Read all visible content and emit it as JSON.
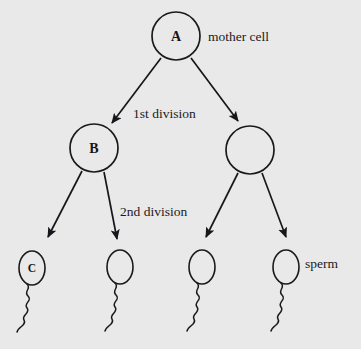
{
  "diagram": {
    "background_color": "#e9e9e9",
    "ink_color": "#1a1a1e",
    "cells": [
      {
        "id": "mother-cell",
        "label": "A",
        "annotation": "mother cell",
        "shape": "circle",
        "cx": 176,
        "cy": 36,
        "r": 24,
        "annotation_x": 208,
        "annotation_y": 41
      },
      {
        "id": "daughter-cell-left",
        "label": "B",
        "annotation": "",
        "shape": "circle",
        "cx": 94,
        "cy": 148,
        "r": 24,
        "annotation_x": 0,
        "annotation_y": 0
      },
      {
        "id": "daughter-cell-right",
        "label": "",
        "annotation": "",
        "shape": "circle",
        "cx": 250,
        "cy": 150,
        "r": 24,
        "annotation_x": 0,
        "annotation_y": 0
      }
    ],
    "sperm": [
      {
        "id": "sperm-1",
        "label": "C",
        "annotation": "",
        "cx": 32,
        "cy": 268,
        "rx": 13,
        "ry": 17,
        "annotation_x": 0,
        "annotation_y": 0
      },
      {
        "id": "sperm-2",
        "label": "",
        "annotation": "",
        "cx": 120,
        "cy": 267,
        "rx": 13,
        "ry": 17,
        "annotation_x": 0,
        "annotation_y": 0
      },
      {
        "id": "sperm-3",
        "label": "",
        "annotation": "",
        "cx": 202,
        "cy": 267,
        "rx": 13,
        "ry": 17,
        "annotation_x": 0,
        "annotation_y": 0
      },
      {
        "id": "sperm-4",
        "label": "",
        "annotation": "sperm",
        "cx": 286,
        "cy": 267,
        "rx": 13,
        "ry": 17,
        "annotation_x": 305,
        "annotation_y": 268
      }
    ],
    "stage_labels": [
      {
        "id": "first-division-label",
        "text": "1st division",
        "x": 133,
        "y": 118
      },
      {
        "id": "second-division-label",
        "text": "2nd division",
        "x": 120,
        "y": 216
      }
    ],
    "annotations": [
      {
        "id": "mother-cell-annotation",
        "text": "mother cell"
      },
      {
        "id": "sperm-annotation",
        "text": "sperm"
      }
    ],
    "arrows": [
      {
        "id": "arrow-a-to-b",
        "x1": 161,
        "y1": 58,
        "x2": 110,
        "y2": 126
      },
      {
        "id": "arrow-a-to-right",
        "x1": 191,
        "y1": 58,
        "x2": 240,
        "y2": 124
      },
      {
        "id": "arrow-b-to-sperm1",
        "x1": 82,
        "y1": 171,
        "x2": 46,
        "y2": 240
      },
      {
        "id": "arrow-b-to-sperm2",
        "x1": 104,
        "y1": 172,
        "x2": 118,
        "y2": 242
      },
      {
        "id": "arrow-right-to-sperm3",
        "x1": 238,
        "y1": 173,
        "x2": 204,
        "y2": 240
      },
      {
        "id": "arrow-right-to-sperm4",
        "x1": 262,
        "y1": 173,
        "x2": 288,
        "y2": 240
      }
    ]
  }
}
